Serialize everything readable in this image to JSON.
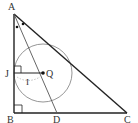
{
  "diagram": {
    "type": "geometry",
    "colors": {
      "stroke": "#222222",
      "circle": "#8a8a8a",
      "bisector": "#555555"
    },
    "points": {
      "A": {
        "label": "A",
        "x": 14,
        "y": 14
      },
      "B": {
        "label": "B",
        "x": 14,
        "y": 113
      },
      "C": {
        "label": "C",
        "x": 127,
        "y": 113
      },
      "D": {
        "label": "D",
        "x": 57,
        "y": 113
      },
      "J": {
        "label": "J",
        "x": 14,
        "y": 73
      },
      "Q": {
        "label": "Q",
        "x": 43,
        "y": 73
      }
    },
    "segments": [
      "AB",
      "BC",
      "CA",
      "AD",
      "JQ"
    ],
    "circle": {
      "center": "Q",
      "radius": 29
    },
    "annotations": {
      "radius_label": "I",
      "right_angle_marks": [
        "B",
        "J"
      ],
      "equal_angle_marks": "two dots at A indicating AD bisects angle A"
    }
  }
}
